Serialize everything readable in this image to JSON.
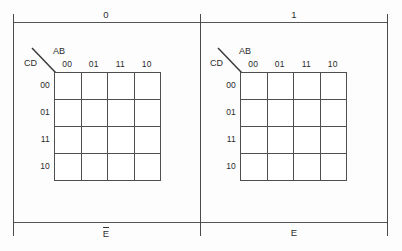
{
  "diagram": {
    "variable_top": "E",
    "maps": [
      {
        "id": "map-e-bar",
        "top_caption": "0",
        "bottom_caption": "E",
        "bottom_caption_overbar": true,
        "row_variable_label": "CD",
        "col_variable_label": "AB",
        "col_headers": [
          "00",
          "01",
          "11",
          "10"
        ],
        "row_headers": [
          "00",
          "01",
          "11",
          "10"
        ],
        "cells": [
          [
            "",
            "",
            "",
            ""
          ],
          [
            "",
            "",
            "",
            ""
          ],
          [
            "",
            "",
            "",
            ""
          ],
          [
            "",
            "",
            "",
            ""
          ]
        ]
      },
      {
        "id": "map-e",
        "top_caption": "1",
        "bottom_caption": "E",
        "bottom_caption_overbar": false,
        "row_variable_label": "CD",
        "col_variable_label": "AB",
        "col_headers": [
          "00",
          "01",
          "11",
          "10"
        ],
        "row_headers": [
          "00",
          "01",
          "11",
          "10"
        ],
        "cells": [
          [
            "",
            "",
            "",
            ""
          ],
          [
            "",
            "",
            "",
            ""
          ],
          [
            "",
            "",
            "",
            ""
          ],
          [
            "",
            "",
            "",
            ""
          ]
        ]
      }
    ],
    "colors": {
      "line": "#4a4a4a",
      "grid_line": "#4f4f4f",
      "text": "#2b2b2b",
      "background": "#fdfdfd"
    }
  }
}
